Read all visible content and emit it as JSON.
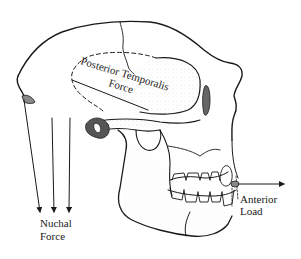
{
  "figure": {
    "background_color": "#ffffff",
    "ink_color": "#1a1a1a",
    "labels": {
      "temporalis_line1": "Posterior Temporalis",
      "temporalis_line2": "Force",
      "nuchal_line1": "Nuchal",
      "nuchal_line2": "Force",
      "anterior_line1": "Anterior",
      "anterior_line2": "Load"
    },
    "forces": [
      {
        "name": "Posterior Temporalis Force",
        "direction": "posterior-superior",
        "style": "solid line within dashed muscle outline"
      },
      {
        "name": "Nuchal Force",
        "direction": "downward",
        "arrows": 3
      },
      {
        "name": "Anterior Load",
        "direction": "anterior (right)",
        "arrows": 1
      }
    ]
  }
}
